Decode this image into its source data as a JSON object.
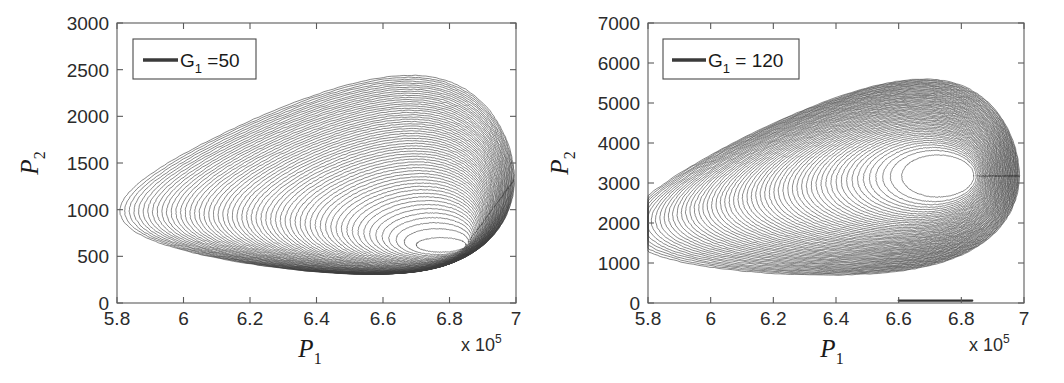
{
  "figure": {
    "background": "#ffffff",
    "trace_color": "#3d3d3d",
    "axis_color": "#5b5b5b",
    "text_color": "#1a1a1a"
  },
  "panels": [
    {
      "id": "left",
      "legend_label": "G",
      "legend_sub": "1",
      "legend_value": " =50",
      "xlabel": "P",
      "xlabel_sub": "1",
      "ylabel": "P",
      "ylabel_sub": "2",
      "exponent_prefix": "x 10",
      "exponent_power": "5",
      "xticks": [
        "5.8",
        "6",
        "6.2",
        "6.4",
        "6.6",
        "6.8",
        "7"
      ],
      "xtick_values": [
        5.8,
        6.0,
        6.2,
        6.4,
        6.6,
        6.8,
        7.0
      ],
      "yticks": [
        "0",
        "500",
        "1000",
        "1500",
        "2000",
        "2500",
        "3000"
      ],
      "ytick_values": [
        0,
        500,
        1000,
        1500,
        2000,
        2500,
        3000
      ],
      "xlim": [
        5.8,
        7.0
      ],
      "ylim": [
        0,
        3000
      ]
    },
    {
      "id": "right",
      "legend_label": "G",
      "legend_sub": "1",
      "legend_value": " = 120",
      "xlabel": "P",
      "xlabel_sub": "1",
      "ylabel": "P",
      "ylabel_sub": "2",
      "exponent_prefix": "x 10",
      "exponent_power": "5",
      "xticks": [
        "5.8",
        "6",
        "6.2",
        "6.4",
        "6.6",
        "6.8",
        "7"
      ],
      "xtick_values": [
        5.8,
        6.0,
        6.2,
        6.4,
        6.6,
        6.8,
        7.0
      ],
      "yticks": [
        "0",
        "1000",
        "2000",
        "3000",
        "4000",
        "5000",
        "6000",
        "7000"
      ],
      "ytick_values": [
        0,
        1000,
        2000,
        3000,
        4000,
        5000,
        6000,
        7000
      ],
      "xlim": [
        5.8,
        7.0
      ],
      "ylim": [
        0,
        7000
      ]
    }
  ],
  "chart_data": [
    {
      "type": "line",
      "panel": "left",
      "title": "",
      "xlabel": "P_1",
      "ylabel": "P_2",
      "x_multiplier": "x 10^5",
      "xlim": [
        5.8,
        7.0
      ],
      "ylim": [
        0,
        3000
      ],
      "xticks": [
        5.8,
        6.0,
        6.2,
        6.4,
        6.6,
        6.8,
        7.0
      ],
      "yticks": [
        0,
        500,
        1000,
        1500,
        2000,
        2500,
        3000
      ],
      "grid": false,
      "legend": [
        {
          "label": "G_1 =50",
          "color": "#3d3d3d"
        }
      ],
      "legend_position": "upper-left",
      "description": "Phase portrait: family of nested closed orbits spiralling outward from an interior focus, forming a comet/teardrop shaped attractor envelope.",
      "series": [
        {
          "name": "G1=50 spiral orbit family",
          "n_loops": 58,
          "focus": {
            "x": 6.775,
            "y": 560
          },
          "envelope_peak": {
            "x": 6.79,
            "y": 2640
          },
          "envelope_right_limit": {
            "x": 7.0,
            "y": 0
          },
          "envelope_left_foot": {
            "x": 5.95,
            "y": 0
          },
          "inner_loop": {
            "x_min": 6.7,
            "x_max": 6.85,
            "y_min": 545,
            "y_max": 700
          },
          "outer_loop": {
            "x_min": 6.03,
            "x_max": 6.995,
            "y_min": 5,
            "y_max": 2640
          }
        }
      ]
    },
    {
      "type": "line",
      "panel": "right",
      "title": "",
      "xlabel": "P_1",
      "ylabel": "P_2",
      "x_multiplier": "x 10^5",
      "xlim": [
        5.8,
        7.0
      ],
      "ylim": [
        0,
        7000
      ],
      "xticks": [
        5.8,
        6.0,
        6.2,
        6.4,
        6.6,
        6.8,
        7.0
      ],
      "yticks": [
        0,
        1000,
        2000,
        3000,
        4000,
        5000,
        6000,
        7000
      ],
      "grid": false,
      "legend": [
        {
          "label": "G_1 = 120",
          "color": "#3d3d3d"
        }
      ],
      "legend_position": "upper-left",
      "description": "Phase portrait: broader triangular attractor with a large empty interior hole; orbits spiral outward from a focus located to the upper right.",
      "series": [
        {
          "name": "G1=120 spiral orbit family",
          "n_loops": 58,
          "focus": {
            "x": 6.735,
            "y": 3150
          },
          "envelope_peak": {
            "x": 6.76,
            "y": 6100
          },
          "envelope_right_limit": {
            "x": 6.98,
            "y": 250
          },
          "envelope_left_foot": {
            "x": 5.945,
            "y": 700
          },
          "inner_loop": {
            "x_min": 6.61,
            "x_max": 6.84,
            "y_min": 2650,
            "y_max": 3700
          },
          "outer_loop": {
            "x_min": 5.945,
            "x_max": 6.985,
            "y_min": 250,
            "y_max": 6100
          }
        }
      ],
      "transient": {
        "name": "near-zero transient segment",
        "x_start": 6.6,
        "x_end": 6.835,
        "y": 60
      }
    }
  ]
}
